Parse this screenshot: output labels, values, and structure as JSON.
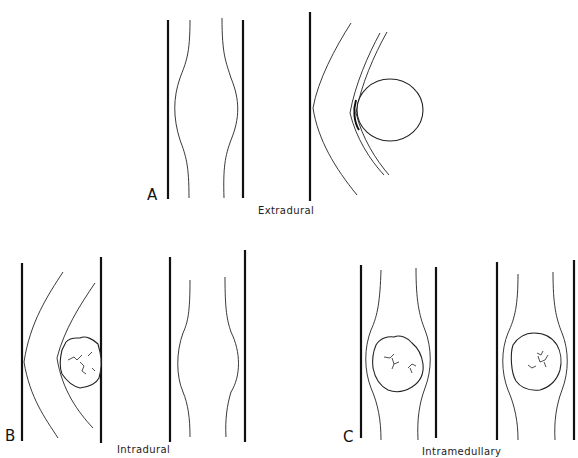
{
  "figure": {
    "panels": [
      {
        "letter": "A",
        "caption": "Extradural",
        "views": [
          "normal-cord-between-dura",
          "extradural-mass-compressing-dura-and-cord"
        ]
      },
      {
        "letter": "B",
        "caption": "Intradural",
        "views": [
          "intradural-mass-displacing-cord",
          "cord-widening-frontal-view"
        ]
      },
      {
        "letter": "C",
        "caption": "Intramedullary",
        "views": [
          "intramedullary-mass-lateral-view",
          "intramedullary-mass-frontal-view"
        ]
      }
    ],
    "colors": {
      "line": "#111111",
      "background": "#ffffff"
    }
  }
}
